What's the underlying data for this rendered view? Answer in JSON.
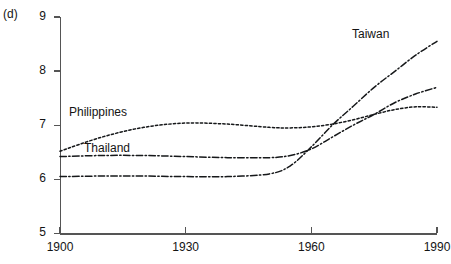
{
  "panel": {
    "label": "(d)"
  },
  "axes": {
    "y": {
      "ticks": [
        "9",
        "8",
        "7",
        "6",
        "5"
      ],
      "min": 5,
      "max": 9
    },
    "x": {
      "ticks": [
        "1900",
        "1930",
        "1960",
        "1990"
      ],
      "min": 1900,
      "max": 1990
    }
  },
  "series_labels": {
    "philippines": "Philippines",
    "thailand": "Thailand",
    "taiwan": "Taiwan"
  },
  "chart_data": {
    "type": "line",
    "title": "(d)",
    "xlabel": "",
    "ylabel": "",
    "xlim": [
      1900,
      1990
    ],
    "ylim": [
      5,
      9
    ],
    "xticks": [
      1900,
      1930,
      1960,
      1990
    ],
    "yticks": [
      5,
      6,
      7,
      8,
      9
    ],
    "grid": false,
    "legend": "inline-labels",
    "x": [
      1900,
      1910,
      1920,
      1930,
      1940,
      1950,
      1955,
      1960,
      1965,
      1970,
      1975,
      1980,
      1985,
      1990
    ],
    "series": [
      {
        "name": "Philippines",
        "style": "dotted",
        "color": "#16181a",
        "values": [
          6.52,
          6.78,
          6.96,
          7.04,
          7.02,
          6.96,
          6.95,
          6.97,
          7.02,
          7.1,
          7.2,
          7.29,
          7.34,
          7.33
        ]
      },
      {
        "name": "Thailand",
        "style": "dash-dot",
        "color": "#16181a",
        "values": [
          6.42,
          6.44,
          6.44,
          6.42,
          6.4,
          6.4,
          6.44,
          6.56,
          6.78,
          7.0,
          7.2,
          7.42,
          7.58,
          7.7
        ]
      },
      {
        "name": "Taiwan",
        "style": "dash-dot",
        "color": "#16181a",
        "values": [
          6.05,
          6.06,
          6.06,
          6.05,
          6.05,
          6.1,
          6.25,
          6.6,
          7.0,
          7.35,
          7.7,
          8.0,
          8.3,
          8.55
        ]
      }
    ]
  }
}
